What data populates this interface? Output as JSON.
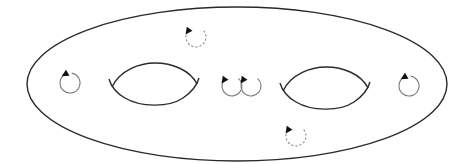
{
  "diagram": {
    "type": "genus-2-surface",
    "colors": {
      "background": "#ffffff",
      "outline": "#2a2a2a",
      "loop_solid": "#7a7a7a",
      "loop_dashed": "#8a8a8a",
      "arrow": "#111111"
    },
    "outer_surface": {
      "cx": 237,
      "cy": 84,
      "rx": 210,
      "ry": 77
    },
    "holes": [
      {
        "id": "left-hole",
        "cx": 153,
        "cy": 85,
        "rx": 43,
        "ry": 22
      },
      {
        "id": "right-hole",
        "cx": 325,
        "cy": 88,
        "rx": 43,
        "ry": 22
      }
    ],
    "loops": [
      {
        "id": "loop-left",
        "cx": 70,
        "cy": 83,
        "r": 10,
        "style": "solid",
        "arrow_at": "top"
      },
      {
        "id": "loop-top-dashed",
        "cx": 196,
        "cy": 37,
        "r": 10,
        "style": "dashed",
        "arrow_at": "top-left"
      },
      {
        "id": "loop-center-a",
        "cx": 232,
        "cy": 86,
        "r": 10,
        "style": "solid",
        "arrow_at": "top-left"
      },
      {
        "id": "loop-center-b",
        "cx": 251,
        "cy": 86,
        "r": 10,
        "style": "solid",
        "arrow_at": "top-left"
      },
      {
        "id": "loop-right",
        "cx": 409,
        "cy": 86,
        "r": 10,
        "style": "solid",
        "arrow_at": "top"
      },
      {
        "id": "loop-bottom-dashed",
        "cx": 296,
        "cy": 136,
        "r": 10,
        "style": "dashed",
        "arrow_at": "top-left"
      }
    ]
  }
}
